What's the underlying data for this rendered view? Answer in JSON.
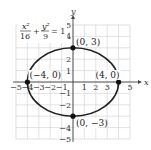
{
  "chart_data": {
    "type": "line",
    "title": "",
    "equation": {
      "x_num": "x²",
      "x_den": "16",
      "plus": "+",
      "y_num": "y²",
      "y_den": "9",
      "rhs": "= 1"
    },
    "xlabel": "x",
    "ylabel": "y",
    "xlim": [
      -5,
      5
    ],
    "ylim": [
      -5,
      5
    ],
    "grid": true,
    "x_ticks": [
      -5,
      -4,
      -3,
      -2,
      -1,
      1,
      2,
      3,
      4,
      5
    ],
    "x_tick_labels": [
      "−5",
      "−4",
      "−3",
      "−2",
      "−1",
      "1",
      "2",
      "3",
      "",
      "5"
    ],
    "y_ticks": [
      5,
      4,
      3,
      2,
      1,
      -1,
      -2,
      -3,
      -4,
      -5
    ],
    "y_tick_labels": [
      "5",
      "4",
      "",
      "2",
      "1",
      "−1",
      "−2",
      "",
      "−4",
      "−5"
    ],
    "series": [
      {
        "name": "ellipse",
        "kind": "ellipse",
        "center": [
          0,
          0
        ],
        "a": 4,
        "b": 3
      }
    ],
    "points": [
      {
        "x": 0,
        "y": 3,
        "label": "(0, 3)"
      },
      {
        "x": 0,
        "y": -3,
        "label": "(0, −3)"
      },
      {
        "x": -4,
        "y": 0,
        "label": "(−4, 0)"
      },
      {
        "x": 4,
        "y": 0,
        "label": "(4, 0)"
      }
    ]
  }
}
